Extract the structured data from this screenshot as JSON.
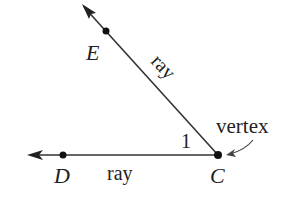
{
  "diagram": {
    "points": {
      "E": {
        "label": "E",
        "x": 106,
        "y": 31
      },
      "D": {
        "label": "D",
        "x": 63,
        "y": 155
      },
      "C": {
        "label": "C",
        "x": 218,
        "y": 155
      }
    },
    "labels": {
      "ray_upper": "ray",
      "ray_lower": "ray",
      "angle": "1",
      "vertex": "vertex"
    },
    "colors": {
      "line": "#333333",
      "text": "#222222"
    }
  }
}
